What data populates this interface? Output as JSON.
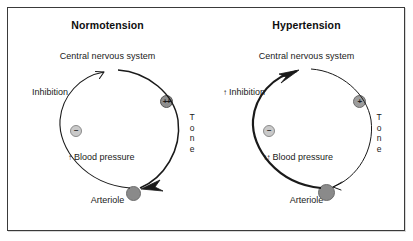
{
  "figure": {
    "type": "diagram",
    "border_color": "#3a3a3a",
    "background": "#ffffff"
  },
  "panels": [
    {
      "id": "normotension",
      "title": "Normotension",
      "nodes": {
        "top_label": "Central nervous system",
        "bottom_label": "Arteriole"
      },
      "left_arc_label": "Inhibition",
      "left_arc_arrow": "",
      "right_arc_label": "Tone",
      "right_arc_letters": [
        "T",
        "o",
        "n",
        "e"
      ],
      "blood_pressure_label": "Blood pressure",
      "blood_pressure_arrows": "↑",
      "badges": [
        {
          "name": "excitatory-badge",
          "symbol": "++",
          "fill": "#8e8e8e"
        },
        {
          "name": "inhibitory-badge",
          "symbol": "−",
          "fill": "#c9c9c9"
        }
      ]
    },
    {
      "id": "hypertension",
      "title": "Hypertension",
      "nodes": {
        "top_label": "Central nervous system",
        "bottom_label": "Arteriole"
      },
      "left_arc_label": "Inhibition",
      "left_arc_arrow": "↑",
      "right_arc_label": "Tone",
      "right_arc_letters": [
        "T",
        "o",
        "n",
        "e"
      ],
      "blood_pressure_label": "Blood pressure",
      "blood_pressure_arrows": "↑↑",
      "badges": [
        {
          "name": "excitatory-badge",
          "symbol": "+",
          "fill": "#9c9c9c"
        },
        {
          "name": "inhibitory-badge",
          "symbol": "−",
          "fill": "#c9c9c9"
        }
      ]
    }
  ],
  "colors": {
    "stroke": "#1a1a1a",
    "arteriole_fill": "#8a8a8a",
    "badge_strong": "#8e8e8e",
    "badge_weak": "#c9c9c9",
    "text": "#1a1a1a"
  }
}
